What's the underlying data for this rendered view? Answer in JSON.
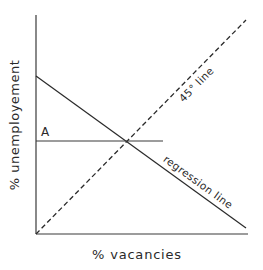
{
  "diagram": {
    "type": "economic-graph",
    "x_axis": {
      "label": "% vacancies"
    },
    "y_axis": {
      "label": "% unemployement"
    },
    "lines": [
      {
        "name": "45-degree line",
        "label": "45° line",
        "style": "dashed"
      },
      {
        "name": "regression line",
        "label": "regression line",
        "style": "solid"
      },
      {
        "name": "horizontal line at A",
        "label": "",
        "style": "solid"
      }
    ],
    "points": [
      {
        "label": "A",
        "description": "intercept on unemployment axis at level where regression line crosses 45° line"
      }
    ],
    "colors": {
      "line": "#333333",
      "background": "#ffffff"
    }
  }
}
